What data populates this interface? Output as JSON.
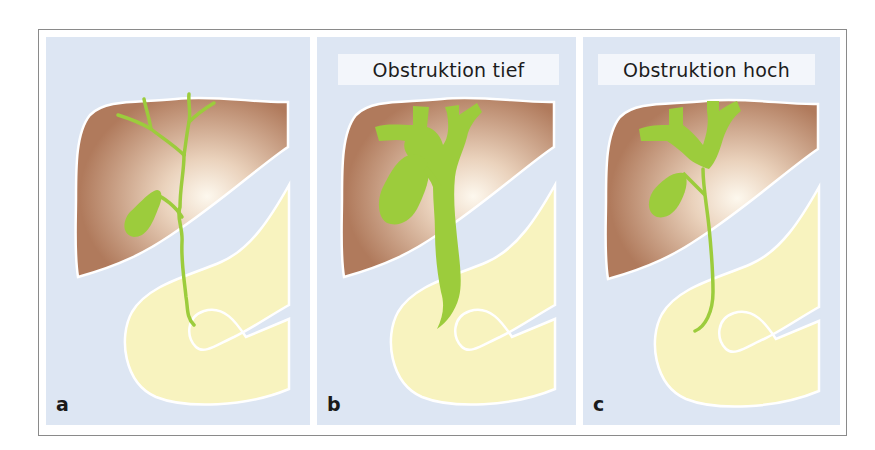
{
  "figure": {
    "panels": [
      {
        "letter": "a",
        "title": null,
        "state": "normal"
      },
      {
        "letter": "b",
        "title": "Obstruktion tief",
        "state": "low obstruction"
      },
      {
        "letter": "c",
        "title": "Obstruktion hoch",
        "state": "high obstruction"
      }
    ]
  },
  "colors": {
    "background": "#dde6f3",
    "liver_edge": "#b07a5c",
    "liver_center": "#fbf3e6",
    "bile_ducts": "#9ccc3c",
    "duodenum": "#f8f3bf",
    "outline": "#ffffff",
    "label_box": "#f3f6fb"
  }
}
